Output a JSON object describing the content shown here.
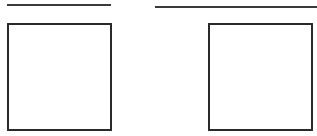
{
  "diagram": {
    "lines": [
      {
        "id": "line-left",
        "label": ""
      },
      {
        "id": "line-right",
        "label": ""
      }
    ],
    "boxes": [
      {
        "id": "box-left",
        "label": ""
      },
      {
        "id": "box-right",
        "label": ""
      }
    ],
    "colors": {
      "stroke": "#2a2a2a",
      "background": "#ffffff"
    }
  }
}
